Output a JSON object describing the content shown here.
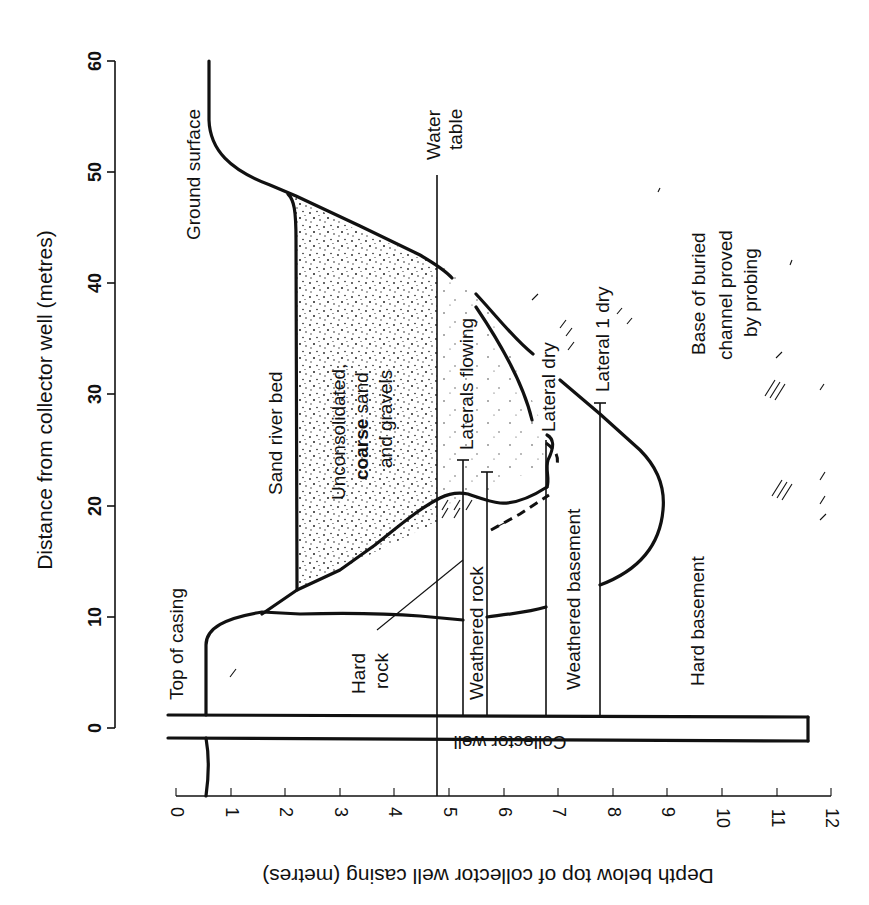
{
  "diagram": {
    "axes": {
      "y_axis": {
        "title": "Distance from collector well (metres)",
        "ticks": [
          "0",
          "10",
          "20",
          "30",
          "40",
          "50",
          "60"
        ],
        "range": [
          0,
          60
        ]
      },
      "x_axis": {
        "title": "Depth below top of collector well casing (metres)",
        "ticks": [
          "0",
          "1",
          "2",
          "3",
          "4",
          "5",
          "6",
          "7",
          "8",
          "9",
          "10",
          "11",
          "12"
        ],
        "range": [
          0,
          12
        ]
      }
    },
    "labels": {
      "ground_surface": "Ground surface",
      "water_table_1": "Water",
      "water_table_2": "table",
      "top_of_casing": "Top of casing",
      "sand_river_bed": "Sand river bed",
      "unconsolidated_1": "Unconsolidated,",
      "unconsolidated_2a": "coarse",
      "unconsolidated_2b": " sand",
      "unconsolidated_3": "and gravels",
      "laterals_flowing": "Laterals flowing",
      "lateral_dry": "Lateral dry",
      "lateral_1_dry": "Lateral 1 dry",
      "base_channel_1": "Base of buried",
      "base_channel_2": "channel proved",
      "base_channel_3": "by probing",
      "hard_rock_1": "Hard",
      "hard_rock_2": "rock",
      "weathered_rock": "Weathered rock",
      "weathered_basement": "Weathered basement",
      "hard_basement": "Hard basement",
      "collector_well": "Collector well"
    },
    "features": {
      "water_table_depth_m": 4.8,
      "collector_well_depth_m": 11.7,
      "laterals": [
        {
          "name": "Laterals flowing (upper)",
          "depth_m": 5.3,
          "distance_to_m": 24
        },
        {
          "name": "Laterals flowing (lower)",
          "depth_m": 5.8,
          "distance_to_m": 23
        },
        {
          "name": "Lateral dry",
          "depth_m": 6.9,
          "distance_to_m": 26.5
        },
        {
          "name": "Lateral 1 dry",
          "depth_m": 7.9,
          "distance_to_m": 29.5
        }
      ]
    }
  }
}
